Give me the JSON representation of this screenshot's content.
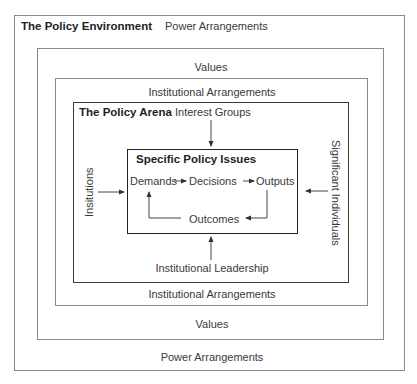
{
  "diagram": {
    "environment": {
      "title": "The Policy Environment",
      "top_label": "Power Arrangements",
      "bottom_label": "Power Arrangements"
    },
    "values": {
      "top_label": "Values",
      "bottom_label": "Values"
    },
    "institutional_arrangements": {
      "top_label": "Institutional Arrangements",
      "bottom_label": "Institutional Arrangements"
    },
    "arena": {
      "title": "The Policy Arena",
      "top_input": "Interest Groups",
      "left_input": "Insitutions",
      "right_input": "Significant Individuals",
      "bottom_input": "Institutional Leadership"
    },
    "issues": {
      "title": "Specific Policy Issues",
      "cycle": [
        "Demands",
        "Decisions",
        "Outputs",
        "Outcomes"
      ]
    },
    "colors": {
      "outer_border": "#8a8a8a",
      "inner_border": "#222222",
      "text": "#3a3a3a"
    }
  }
}
